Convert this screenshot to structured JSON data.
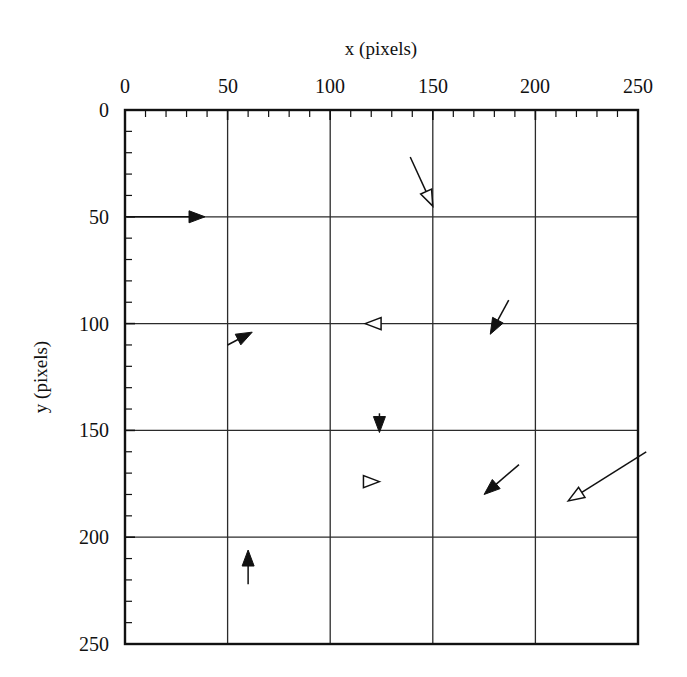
{
  "figure": {
    "kind": "quiver-vector-field",
    "background_color": "#ffffff",
    "ink_color": "#111111",
    "grid_color": "#2b2b2b",
    "frame_color": "#111111"
  },
  "chart_data": {
    "type": "scatter",
    "title": "",
    "xlabel": "x (pixels)",
    "ylabel": "y (pixels)",
    "xlim": [
      0,
      250
    ],
    "ylim": [
      250,
      0
    ],
    "y_axis_inverted": true,
    "xticks": [
      0,
      50,
      100,
      150,
      200,
      250
    ],
    "yticks": [
      0,
      50,
      100,
      150,
      200,
      250
    ],
    "xtick_labels": [
      "0",
      "50",
      "100",
      "150",
      "200",
      "250"
    ],
    "ytick_labels": [
      "0",
      "50",
      "100",
      "150",
      "200",
      "250"
    ],
    "minor_tick_interval": 10,
    "grid": true,
    "grid_axis": "both",
    "legend": "none",
    "x_axis_position": "top",
    "y_axis_position": "left",
    "arrows": [
      {
        "id": "arrow-1",
        "head": "solid",
        "tail_x": 1,
        "tail_y": 50,
        "tip_x": 39,
        "tip_y": 50,
        "dx": 38,
        "dy": 0,
        "angle_deg": 0,
        "length": 38
      },
      {
        "id": "arrow-2",
        "head": "hollow",
        "tail_x": 139,
        "tail_y": 22,
        "tip_x": 150,
        "tip_y": 45,
        "dx": 11,
        "dy": 23,
        "angle_deg": 64,
        "length": 25
      },
      {
        "id": "arrow-3",
        "head": "solid",
        "tail_x": 50,
        "tail_y": 110,
        "tip_x": 62,
        "tip_y": 104,
        "dx": 12,
        "dy": -6,
        "angle_deg": -27,
        "length": 13
      },
      {
        "id": "arrow-4",
        "head": "hollow",
        "tail_x": 124,
        "tail_y": 100,
        "tip_x": 117,
        "tip_y": 100,
        "dx": -7,
        "dy": 0,
        "angle_deg": 180,
        "length": 7
      },
      {
        "id": "arrow-5",
        "head": "solid",
        "tail_x": 187,
        "tail_y": 89,
        "tip_x": 178,
        "tip_y": 105,
        "dx": -9,
        "dy": 16,
        "angle_deg": 119,
        "length": 18
      },
      {
        "id": "arrow-6",
        "head": "solid",
        "tail_x": 124,
        "tail_y": 142,
        "tip_x": 124,
        "tip_y": 151,
        "dx": 0,
        "dy": 9,
        "angle_deg": 90,
        "length": 9
      },
      {
        "id": "arrow-7",
        "head": "hollow",
        "tail_x": 117,
        "tail_y": 174,
        "tip_x": 124,
        "tip_y": 174,
        "dx": 7,
        "dy": 0,
        "angle_deg": 0,
        "length": 7
      },
      {
        "id": "arrow-8",
        "head": "solid",
        "tail_x": 192,
        "tail_y": 166,
        "tip_x": 175,
        "tip_y": 180,
        "dx": -17,
        "dy": 14,
        "angle_deg": 140,
        "length": 22
      },
      {
        "id": "arrow-9",
        "head": "hollow",
        "tail_x": 254,
        "tail_y": 160,
        "tip_x": 216,
        "tip_y": 183,
        "dx": -38,
        "dy": 23,
        "angle_deg": 149,
        "length": 44
      },
      {
        "id": "arrow-10",
        "head": "solid",
        "tail_x": 60,
        "tail_y": 222,
        "tip_x": 60,
        "tip_y": 206,
        "dx": 0,
        "dy": -16,
        "angle_deg": -90,
        "length": 16
      }
    ]
  }
}
